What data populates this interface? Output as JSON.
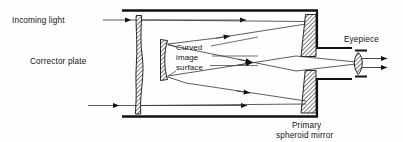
{
  "figure": {
    "background_color": "#fefefe",
    "line_color": "#111111",
    "hatch_color": "#111111"
  },
  "labels": {
    "incoming_light": "Incoming light",
    "corrector_plate": "Corrector plate",
    "curved_image_1": "Curved",
    "curved_image_2": "image",
    "curved_image_3": "surface",
    "eyepiece": "Eyepiece",
    "primary_mirror_1": "Primary",
    "primary_mirror_2": "spheroid mirror"
  },
  "components": [
    {
      "name": "telescope-tube-top",
      "kind": "tube-wall"
    },
    {
      "name": "telescope-tube-bottom",
      "kind": "tube-wall"
    },
    {
      "name": "corrector-plate",
      "kind": "aspheric-lens"
    },
    {
      "name": "curved-image-surface",
      "kind": "focal-surface"
    },
    {
      "name": "primary-spheroid-mirror-upper",
      "kind": "mirror-segment"
    },
    {
      "name": "primary-spheroid-mirror-lower",
      "kind": "mirror-segment"
    },
    {
      "name": "eyepiece-lens",
      "kind": "biconvex-lens"
    }
  ],
  "rays": [
    {
      "name": "incoming-ray-upper",
      "direction": "right"
    },
    {
      "name": "incoming-ray-lower",
      "direction": "right"
    },
    {
      "name": "reflected-ray-upper",
      "direction": "left"
    },
    {
      "name": "reflected-ray-lower",
      "direction": "left"
    },
    {
      "name": "exit-ray-upper",
      "direction": "right"
    },
    {
      "name": "exit-ray-lower",
      "direction": "right"
    },
    {
      "name": "eyepiece-output-upper",
      "direction": "right"
    },
    {
      "name": "eyepiece-output-lower",
      "direction": "right"
    }
  ]
}
